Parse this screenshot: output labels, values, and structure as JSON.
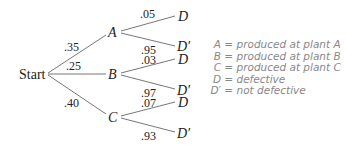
{
  "diagram": {
    "type": "probability-tree",
    "root": {
      "label": "Start"
    },
    "level1": [
      {
        "node": "A",
        "prob": ".35"
      },
      {
        "node": "B",
        "prob": ".25"
      },
      {
        "node": "C",
        "prob": ".40"
      }
    ],
    "level2": {
      "A": [
        {
          "node": "D",
          "prob": ".05"
        },
        {
          "node": "D′",
          "prob": ".95"
        }
      ],
      "B": [
        {
          "node": "D",
          "prob": ".03"
        },
        {
          "node": "D′",
          "prob": ".97"
        }
      ],
      "C": [
        {
          "node": "D",
          "prob": ".07"
        },
        {
          "node": "D′",
          "prob": ".93"
        }
      ]
    }
  },
  "legend": [
    {
      "symbol": "A",
      "text": "= produced at plant A"
    },
    {
      "symbol": "B",
      "text": "= produced at plant B"
    },
    {
      "symbol": "C",
      "text": "= produced at plant C"
    },
    {
      "symbol": "D",
      "text": "= defective"
    },
    {
      "symbol": "D′",
      "text": "= not defective"
    }
  ]
}
